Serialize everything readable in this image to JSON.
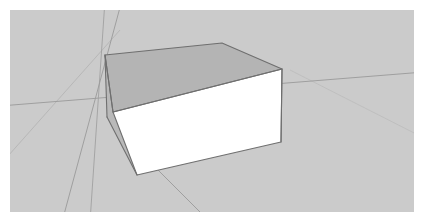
{
  "app": {
    "name": "3D Modeling Viewport",
    "window_title": "Untitled Model",
    "tool": "select-tool"
  },
  "canvas": {
    "width": 424,
    "height": 223,
    "page_background": "#ffffff",
    "viewport": {
      "x": 10,
      "y": 10,
      "width": 404,
      "height": 202,
      "label": "Model View",
      "border_color": "#d6d6d6"
    }
  },
  "scene": {
    "background": {
      "sky_color": "#cbcbcb",
      "ground_color": "#c6c6c6",
      "horizon_label": "Ground Plane"
    },
    "axes": [
      {
        "name": "red-axis",
        "label": "Red Axis",
        "color": "#9a9a9a",
        "x1": -10,
        "y1": 96,
        "x2": 414,
        "y2": 62
      },
      {
        "name": "green-axis",
        "label": "Green Axis",
        "color": "#9a9a9a",
        "x1": 112,
        "y1": -10,
        "x2": 52,
        "y2": 212
      },
      {
        "name": "green-axis-extension",
        "label": "Green Axis Extension",
        "color": "#9a9a9a",
        "x1": 100,
        "y1": 112,
        "x2": 200,
        "y2": 212
      },
      {
        "name": "blue-axis",
        "label": "Blue Axis",
        "color": "#a0a0a0",
        "x1": 95,
        "y1": -10,
        "x2": 80,
        "y2": 212
      }
    ],
    "ground_seams": [
      {
        "name": "ground-seam-left",
        "color": "#b4b4b4",
        "x1": -10,
        "y1": 155,
        "x2": 110,
        "y2": 20
      },
      {
        "name": "ground-seam-right",
        "color": "#bdbdbd",
        "x1": 280,
        "y1": 60,
        "x2": 414,
        "y2": 128
      }
    ],
    "object": {
      "name": "box",
      "label": "Box",
      "type": "cuboid",
      "edge_color": "#6f6f6f",
      "edge_width": 1.1,
      "faces": {
        "front": {
          "name": "front-face",
          "label": "Front Face",
          "color": "#ffffff"
        },
        "top": {
          "name": "top-face",
          "label": "Top Face",
          "color": "#b4b4b4"
        },
        "left": {
          "name": "left-face",
          "label": "Left Face",
          "color": "#b9b9b9"
        }
      },
      "vertices": {
        "top_back_left": [
          95,
          45
        ],
        "top_back_right": [
          212,
          33
        ],
        "top_front_right": [
          272,
          59
        ],
        "top_front_left": [
          103,
          102
        ],
        "bottom_front_left": [
          127,
          165
        ],
        "bottom_front_right": [
          271,
          132
        ],
        "bottom_back_left": [
          97,
          107
        ]
      }
    }
  },
  "status": {
    "tool_label": "Select",
    "measurement_label": "Dimensions",
    "measurement_value": ""
  }
}
